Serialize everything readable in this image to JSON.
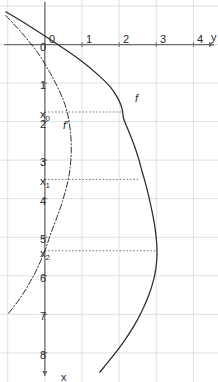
{
  "figure": {
    "panel_label": "d)",
    "background_color": "#ffffff",
    "grid_color": "#c9d6e2",
    "axis_color": "#6b6b6b",
    "curve_color": "#2b2b2b",
    "helper_line_color": "#555555",
    "rotation_degrees": 90
  },
  "axes": {
    "x": {
      "name": "x",
      "min": -1,
      "max": 8.6,
      "tick_labels": [
        "0",
        "1",
        "2",
        "3",
        "4",
        "5",
        "6",
        "7",
        "8"
      ],
      "tick_values": [
        0,
        1,
        2,
        3,
        4,
        5,
        6,
        7,
        8
      ],
      "special_labels": [
        {
          "text": "x",
          "sub": "0",
          "value": 1.75
        },
        {
          "text": "x",
          "sub": "1",
          "value": 3.5
        },
        {
          "text": "x",
          "sub": "2",
          "value": 5.35
        }
      ],
      "arrow": true
    },
    "y": {
      "name": "y",
      "min": -1.1,
      "max": 4.5,
      "tick_labels": [
        "0",
        "1",
        "2",
        "3",
        "4"
      ],
      "tick_values": [
        0,
        1,
        2,
        3,
        4
      ],
      "arrow": true
    }
  },
  "chart_data": {
    "type": "line",
    "title": "",
    "xlabel": "x",
    "ylabel": "y",
    "xlim": [
      -1,
      8.6
    ],
    "ylim": [
      -1.1,
      4.5
    ],
    "grid": true,
    "legend": "inline-labels",
    "annotations": [
      {
        "label": "f",
        "x": 1.25,
        "y": 2.42,
        "series": "f"
      },
      {
        "label": "f'",
        "x": 1.95,
        "y": 0.48,
        "series": "f-prime"
      }
    ],
    "marked_points": [
      {
        "name": "x0",
        "x": 1.75,
        "label": "x_0",
        "dashed_to_curve": true,
        "curve_y": 2.1
      },
      {
        "name": "x1",
        "x": 3.5,
        "label": "x_1",
        "dashed_to_curve": true,
        "curve_y": 2.55
      },
      {
        "name": "x2",
        "x": 5.35,
        "label": "x_2",
        "dashed_to_curve": true,
        "curve_y": 3.02
      }
    ],
    "series": [
      {
        "name": "f",
        "style": "solid",
        "color": "#2b2b2b",
        "x": [
          -0.85,
          -0.5,
          0.0,
          0.4,
          0.8,
          1.1,
          1.35,
          1.55,
          1.7,
          1.8,
          1.9,
          2.05,
          2.3,
          2.6,
          2.95,
          3.3,
          3.6,
          3.95,
          4.3,
          4.6,
          4.9,
          5.15,
          5.35,
          5.55,
          5.8,
          6.1,
          6.5,
          6.9,
          7.3,
          7.7,
          8.1,
          8.5
        ],
        "y": [
          -1.05,
          -0.45,
          0.35,
          0.95,
          1.45,
          1.76,
          1.94,
          2.04,
          2.085,
          2.1,
          2.115,
          2.17,
          2.28,
          2.4,
          2.52,
          2.62,
          2.71,
          2.8,
          2.88,
          2.94,
          2.985,
          3.01,
          3.02,
          3.015,
          2.99,
          2.93,
          2.8,
          2.62,
          2.4,
          2.13,
          1.82,
          1.48
        ]
      },
      {
        "name": "f-prime",
        "style": "dash-dot",
        "color": "#2b2b2b",
        "x": [
          -0.75,
          -0.3,
          0.2,
          0.7,
          1.1,
          1.45,
          1.75,
          2.05,
          2.4,
          2.8,
          3.2,
          3.5,
          3.85,
          4.2,
          4.55,
          4.9,
          5.35,
          5.8,
          6.2,
          6.6,
          7.0
        ],
        "y": [
          -1.05,
          -0.62,
          -0.2,
          0.12,
          0.34,
          0.5,
          0.6,
          0.66,
          0.7,
          0.71,
          0.68,
          0.63,
          0.54,
          0.43,
          0.3,
          0.16,
          0.0,
          -0.2,
          -0.42,
          -0.68,
          -1.0
        ]
      }
    ]
  }
}
